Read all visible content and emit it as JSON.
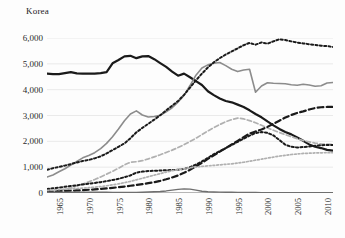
{
  "title": "Korea",
  "axes": {
    "y_ticks": [
      "0",
      "1,000",
      "2,000",
      "3,000",
      "4,000",
      "5,000",
      "6,000"
    ],
    "x_ticks": [
      "1965",
      "1970",
      "1975",
      "1980",
      "1985",
      "1990",
      "1995",
      "2000",
      "2005",
      "2010"
    ]
  },
  "colors": {
    "black": "#1a1a1a",
    "gray": "#8c8c8c",
    "light_gray": "#b0b0b0",
    "gridline": "#e4e4e4",
    "axis": "#6f6f6f",
    "text": "#2b2b2b"
  },
  "chart_data": {
    "type": "line",
    "title": "Korea",
    "xlabel": "",
    "ylabel": "",
    "xlim": [
      1963,
      2011
    ],
    "ylim": [
      0,
      6000
    ],
    "ytick_step": 1000,
    "grid": "horizontal",
    "legend": "none",
    "x": [
      1963,
      1964,
      1965,
      1966,
      1967,
      1968,
      1969,
      1970,
      1971,
      1972,
      1973,
      1974,
      1975,
      1976,
      1977,
      1978,
      1979,
      1980,
      1981,
      1982,
      1983,
      1984,
      1985,
      1986,
      1987,
      1988,
      1989,
      1990,
      1991,
      1992,
      1993,
      1994,
      1995,
      1996,
      1997,
      1998,
      1999,
      2000,
      2001,
      2002,
      2003,
      2004,
      2005,
      2006,
      2007,
      2008,
      2009,
      2010,
      2011
    ],
    "series": [
      {
        "name": "series-1-black-solid",
        "style": "solid",
        "color": "#1a1a1a",
        "width": 2.2,
        "values": [
          4620,
          4600,
          4600,
          4640,
          4680,
          4630,
          4620,
          4620,
          4620,
          4640,
          4680,
          5020,
          5150,
          5290,
          5310,
          5220,
          5290,
          5300,
          5180,
          5030,
          4880,
          4700,
          4540,
          4620,
          4480,
          4330,
          4180,
          3940,
          3790,
          3660,
          3560,
          3510,
          3420,
          3330,
          3200,
          3060,
          2930,
          2770,
          2620,
          2480,
          2360,
          2270,
          2150,
          2020,
          1880,
          1790,
          1740,
          1670,
          1640
        ]
      },
      {
        "name": "series-2-gray-solid",
        "style": "solid",
        "color": "#8c8c8c",
        "width": 1.6,
        "values": [
          620,
          700,
          820,
          940,
          1080,
          1220,
          1360,
          1450,
          1560,
          1720,
          1920,
          2180,
          2480,
          2800,
          3060,
          3180,
          3020,
          2940,
          2960,
          3010,
          3140,
          3300,
          3520,
          3780,
          4160,
          4560,
          4840,
          4960,
          5020,
          5050,
          4930,
          4790,
          4700,
          4760,
          4790,
          3900,
          4140,
          4270,
          4250,
          4240,
          4230,
          4190,
          4170,
          4210,
          4180,
          4130,
          4150,
          4260,
          4280
        ]
      },
      {
        "name": "series-3-black-dotted-high",
        "style": "dotted",
        "color": "#1a1a1a",
        "width": 2.0,
        "values": [
          900,
          960,
          1010,
          1060,
          1120,
          1180,
          1240,
          1280,
          1340,
          1420,
          1530,
          1660,
          1790,
          1920,
          2120,
          2350,
          2520,
          2680,
          2840,
          3010,
          3200,
          3380,
          3560,
          3800,
          4080,
          4360,
          4620,
          4860,
          5060,
          5220,
          5360,
          5480,
          5600,
          5720,
          5810,
          5740,
          5830,
          5780,
          5870,
          5950,
          5920,
          5870,
          5820,
          5790,
          5760,
          5730,
          5700,
          5690,
          5650
        ]
      },
      {
        "name": "series-4-gray-dashed",
        "style": "dashed",
        "color": "#b0b0b0",
        "width": 1.7,
        "values": [
          0,
          30,
          80,
          140,
          200,
          270,
          350,
          430,
          520,
          620,
          730,
          840,
          960,
          1090,
          1190,
          1210,
          1250,
          1320,
          1400,
          1480,
          1570,
          1660,
          1760,
          1870,
          1990,
          2120,
          2260,
          2400,
          2530,
          2650,
          2760,
          2840,
          2900,
          2870,
          2800,
          2720,
          2620,
          2520,
          2430,
          2340,
          2260,
          2180,
          2100,
          2030,
          1980,
          1930,
          1900,
          1890,
          1880
        ]
      },
      {
        "name": "series-5-black-dotted-low",
        "style": "dotted",
        "color": "#1a1a1a",
        "width": 2.0,
        "values": [
          150,
          180,
          210,
          240,
          270,
          300,
          330,
          360,
          390,
          420,
          460,
          500,
          550,
          610,
          680,
          790,
          830,
          850,
          860,
          870,
          880,
          890,
          900,
          930,
          1000,
          1100,
          1220,
          1360,
          1500,
          1620,
          1740,
          1860,
          1980,
          2100,
          2220,
          2320,
          2360,
          2330,
          2230,
          2050,
          1870,
          1790,
          1760,
          1780,
          1800,
          1830,
          1850,
          1860,
          1860
        ]
      },
      {
        "name": "series-6-black-dashed",
        "style": "dashed",
        "color": "#1a1a1a",
        "width": 2.2,
        "values": [
          50,
          60,
          70,
          80,
          90,
          100,
          110,
          125,
          140,
          160,
          180,
          200,
          225,
          250,
          280,
          310,
          345,
          380,
          420,
          470,
          530,
          600,
          680,
          780,
          900,
          1030,
          1170,
          1320,
          1460,
          1600,
          1740,
          1880,
          2020,
          2160,
          2300,
          2380,
          2460,
          2560,
          2680,
          2800,
          2920,
          3020,
          3100,
          3160,
          3230,
          3290,
          3320,
          3330,
          3330
        ]
      },
      {
        "name": "series-7-gray-dotted",
        "style": "dotted",
        "color": "#b0b0b0",
        "width": 1.7,
        "values": [
          100,
          115,
          130,
          145,
          160,
          175,
          190,
          205,
          225,
          250,
          280,
          315,
          355,
          400,
          450,
          510,
          570,
          630,
          690,
          750,
          810,
          860,
          900,
          940,
          980,
          1010,
          1030,
          1050,
          1070,
          1090,
          1110,
          1130,
          1160,
          1190,
          1230,
          1270,
          1310,
          1350,
          1390,
          1430,
          1460,
          1490,
          1510,
          1530,
          1540,
          1550,
          1555,
          1560,
          1560
        ]
      },
      {
        "name": "series-8-gray-baseline",
        "style": "solid",
        "color": "#6f6f6f",
        "width": 1.4,
        "values": [
          30,
          30,
          30,
          30,
          30,
          30,
          30,
          30,
          30,
          30,
          28,
          26,
          24,
          22,
          20,
          22,
          30,
          40,
          50,
          60,
          80,
          110,
          140,
          160,
          150,
          110,
          70,
          50,
          40,
          35,
          30,
          28,
          25,
          22,
          20,
          18,
          16,
          15,
          14,
          13,
          12,
          12,
          11,
          11,
          10,
          10,
          10,
          10,
          10
        ]
      }
    ]
  }
}
